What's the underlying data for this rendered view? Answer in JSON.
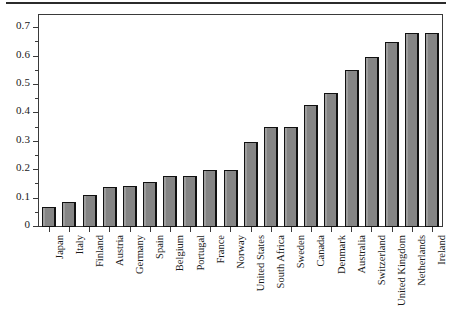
{
  "chart_data": {
    "type": "bar",
    "title": "",
    "subtitle": "",
    "xlabel": "",
    "ylabel": "",
    "ylim": [
      0,
      0.75
    ],
    "ytick_labels": [
      "0",
      "0.1",
      "0.2",
      "0.3",
      "0.4",
      "0.5",
      "0.6",
      "0.7"
    ],
    "ytick_values": [
      0,
      0.1,
      0.2,
      0.3,
      0.4,
      0.5,
      0.6,
      0.7
    ],
    "yminor_values": [
      0.05,
      0.15,
      0.25,
      0.35,
      0.45,
      0.55,
      0.65
    ],
    "grid": false,
    "legend": null,
    "orientation": "vertical",
    "bar_color": "#858585",
    "bar_edge_color": "#111111",
    "axis_color": "#3a3a3a",
    "categories": [
      "Japan",
      "Italy",
      "Finland",
      "Austria",
      "Germany",
      "Spain",
      "Belgium",
      "Portugal",
      "France",
      "Norway",
      "United States",
      "South Africa",
      "Sweden",
      "Canada",
      "Denmark",
      "Australia",
      "Switzerland",
      "United Kingdom",
      "Netherlands",
      "Ireland"
    ],
    "values": [
      0.07,
      0.09,
      0.115,
      0.14,
      0.145,
      0.16,
      0.18,
      0.18,
      0.2,
      0.2,
      0.3,
      0.355,
      0.355,
      0.43,
      0.475,
      0.555,
      0.6,
      0.655,
      0.685,
      0.685
    ]
  }
}
